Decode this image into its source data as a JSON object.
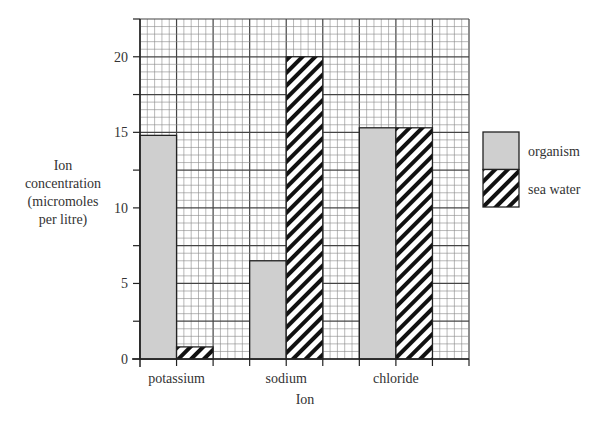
{
  "chart_data": {
    "type": "bar",
    "title": "",
    "xlabel": "Ion",
    "ylabel_lines": [
      "Ion",
      "concentration",
      "(micromoles",
      "per litre)"
    ],
    "ylabel": "Ion concentration (micromoles per litre)",
    "categories": [
      "potassium",
      "sodium",
      "chloride"
    ],
    "series": [
      {
        "name": "organism",
        "pattern": "solid-grey",
        "values": [
          14.8,
          6.5,
          15.3
        ]
      },
      {
        "name": "sea water",
        "pattern": "diagonal-hatch",
        "values": [
          0.8,
          20.0,
          15.3
        ]
      }
    ],
    "ylim": [
      0,
      22.5
    ],
    "yticks": [
      0,
      5,
      10,
      15,
      20
    ],
    "grid": true,
    "legend_position": "right",
    "colors": {
      "organism": "#cfcfcf",
      "hatch": "#111111",
      "grid": "#555555",
      "axis": "#222222"
    }
  }
}
